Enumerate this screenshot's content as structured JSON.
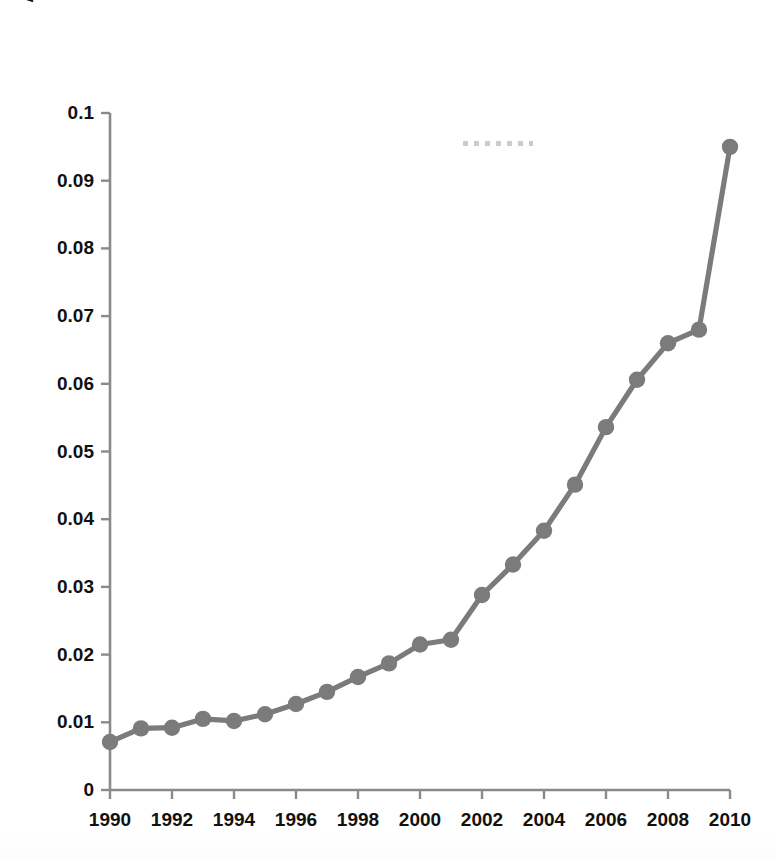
{
  "chart_data": {
    "type": "line",
    "title": "",
    "xlabel": "",
    "ylabel": "Analytics and Data Science Job Starters (as a percentage of all job starters)",
    "x": [
      1990,
      1991,
      1992,
      1993,
      1994,
      1995,
      1996,
      1997,
      1998,
      1999,
      2000,
      2001,
      2002,
      2003,
      2004,
      2005,
      2006,
      2007,
      2008,
      2009,
      2010
    ],
    "values": [
      0.0071,
      0.0091,
      0.0092,
      0.0105,
      0.0102,
      0.0112,
      0.0127,
      0.0145,
      0.0167,
      0.0187,
      0.0215,
      0.0222,
      0.0288,
      0.0333,
      0.0383,
      0.0451,
      0.0536,
      0.0606,
      0.066,
      0.068,
      0.095
    ],
    "series": [
      {
        "name": "Analytics and Data Science Job Starters",
        "values": [
          0.0071,
          0.0091,
          0.0092,
          0.0105,
          0.0102,
          0.0112,
          0.0127,
          0.0145,
          0.0167,
          0.0187,
          0.0215,
          0.0222,
          0.0288,
          0.0333,
          0.0383,
          0.0451,
          0.0536,
          0.0606,
          0.066,
          0.068,
          0.095
        ]
      }
    ],
    "xlim": [
      1990,
      2010
    ],
    "ylim": [
      0,
      0.1
    ],
    "ytick_labels": [
      "0",
      "0.01",
      "0.02",
      "0.03",
      "0.04",
      "0.05",
      "0.06",
      "0.07",
      "0.08",
      "0.09",
      "0.1"
    ],
    "ytick_values": [
      0,
      0.01,
      0.02,
      0.03,
      0.04,
      0.05,
      0.06,
      0.07,
      0.08,
      0.09,
      0.1
    ],
    "xtick_labels": [
      "1990",
      "1992",
      "1994",
      "1996",
      "1998",
      "2000",
      "2002",
      "2004",
      "2006",
      "2008",
      "2010"
    ],
    "xtick_values": [
      1990,
      1992,
      1994,
      1996,
      1998,
      2000,
      2002,
      2004,
      2006,
      2008,
      2010
    ],
    "grid": false,
    "legend": false,
    "legend_position": "none",
    "line_color": "#7b7b7b",
    "marker_color": "#7b7b7b",
    "axis_color": "#8a8a8a",
    "text_color": "#111111",
    "marker": "circle",
    "annotations": []
  }
}
